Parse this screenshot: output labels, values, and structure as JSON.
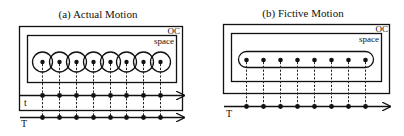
{
  "panels": {
    "a": {
      "title": "(a) Actual Motion",
      "outer_label": "OC",
      "inner_label": "space",
      "axes": [
        {
          "label": "t"
        },
        {
          "label": "T"
        }
      ],
      "points": 8,
      "point_shape": "circled-dot"
    },
    "b": {
      "title": "(b) Fictive Motion",
      "outer_label": "OC",
      "inner_label": "space",
      "axes": [
        {
          "label": "T"
        }
      ],
      "points": 8,
      "point_shape": "dot-in-pill"
    }
  },
  "colors": {
    "ink": "#111111",
    "background": "#ffffff"
  }
}
